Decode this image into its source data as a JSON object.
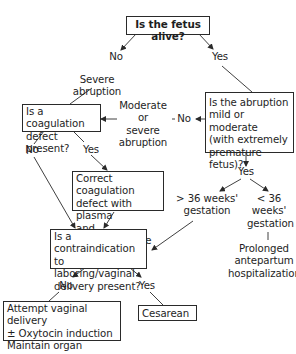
{
  "flowchart": {
    "nodes": {
      "fetus_alive": "Is the fetus alive?",
      "coag_defect": "Is a coagulation\ndefect present?",
      "abruption_mild": "Is the abruption\nmild or moderate\n(with extremely\npremature fetus)?",
      "correct_coag": "Correct coagulation\ndefect with plasma\nand cryoprecipitate",
      "contraindication": "Is a contraindication\nto laboring/vaginal\ndelivery present?",
      "attempt_vaginal": "Attempt vaginal delivery\n± Oxytocin induction\nMaintain organ perfusion",
      "cesarean": "Cesarean"
    },
    "labels": {
      "no_top": "No",
      "yes_top": "Yes",
      "severe_abruption": "Severe abruption",
      "moderate_severe": "Moderate\nor\nsevere\nabruption",
      "no_mid": "No",
      "coag_no": "No",
      "coag_yes": "Yes",
      "abruption_yes": "Yes",
      "gt36": "> 36 weeks'\ngestation",
      "lt36": "< 36\nweeks'\ngestation",
      "prolonged": "Prolonged\nantepartum\nhospitalization",
      "contra_no": "No",
      "contra_yes": "Yes"
    },
    "colors": {
      "line": "#2a2a2a",
      "text": "#1e1e1e",
      "background": "#ffffff"
    }
  }
}
